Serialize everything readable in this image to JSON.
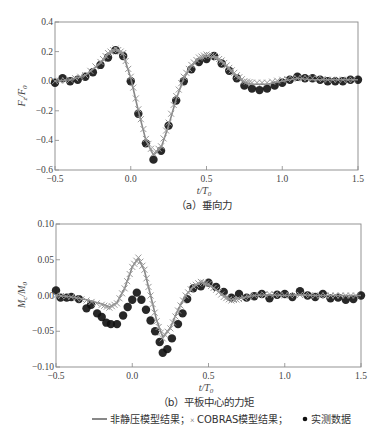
{
  "chart_data": [
    {
      "type": "line",
      "title": "(a) 垂向力",
      "caption": "（a）垂向力",
      "xlabel": "t/T0",
      "ylabel": "Fz/F0",
      "xlim": [
        -0.5,
        1.5
      ],
      "ylim": [
        -0.6,
        0.4
      ],
      "xticks": [
        "-0.5",
        "0.0",
        "0.5",
        "1.0",
        "1.5"
      ],
      "yticks": [
        "0.4",
        "0.2",
        "0.0",
        "-0.2",
        "-0.4",
        "-0.6"
      ],
      "grid": false,
      "series": [
        {
          "name": "非静压模型结果",
          "style": "line",
          "color": "#888888",
          "x": [
            -0.5,
            -0.4,
            -0.3,
            -0.2,
            -0.15,
            -0.1,
            -0.05,
            0.0,
            0.05,
            0.1,
            0.15,
            0.2,
            0.25,
            0.3,
            0.35,
            0.4,
            0.45,
            0.5,
            0.55,
            0.6,
            0.65,
            0.7,
            0.75,
            0.8,
            0.9,
            1.0,
            1.1,
            1.2,
            1.3,
            1.4,
            1.5
          ],
          "y": [
            0.0,
            0.01,
            0.04,
            0.12,
            0.18,
            0.21,
            0.18,
            0.02,
            -0.2,
            -0.4,
            -0.5,
            -0.45,
            -0.3,
            -0.12,
            0.02,
            0.1,
            0.15,
            0.17,
            0.16,
            0.13,
            0.08,
            0.03,
            -0.01,
            -0.02,
            -0.02,
            0.0,
            0.02,
            0.01,
            0.01,
            0.01,
            0.01
          ]
        },
        {
          "name": "COBRAS模型结果",
          "style": "x-marker",
          "color": "#999999",
          "x": [
            -0.5,
            -0.4,
            -0.3,
            -0.2,
            -0.15,
            -0.1,
            -0.05,
            0.0,
            0.05,
            0.1,
            0.15,
            0.2,
            0.25,
            0.3,
            0.35,
            0.4,
            0.45,
            0.5,
            0.55,
            0.6,
            0.65,
            0.7,
            0.75,
            0.8,
            0.9,
            1.0,
            1.1,
            1.2,
            1.3,
            1.4,
            1.5
          ],
          "y": [
            0.0,
            0.01,
            0.04,
            0.13,
            0.19,
            0.22,
            0.19,
            0.03,
            -0.19,
            -0.39,
            -0.49,
            -0.44,
            -0.28,
            -0.1,
            0.03,
            0.11,
            0.16,
            0.18,
            0.17,
            0.14,
            0.09,
            0.04,
            0.0,
            -0.01,
            -0.01,
            0.01,
            0.02,
            0.02,
            0.01,
            0.01,
            0.01
          ]
        },
        {
          "name": "实测数据",
          "style": "dot",
          "color": "#111111",
          "x": [
            -0.5,
            -0.45,
            -0.4,
            -0.35,
            -0.3,
            -0.25,
            -0.2,
            -0.15,
            -0.1,
            -0.05,
            0.0,
            0.05,
            0.1,
            0.15,
            0.2,
            0.25,
            0.3,
            0.35,
            0.4,
            0.45,
            0.5,
            0.55,
            0.6,
            0.65,
            0.7,
            0.75,
            0.8,
            0.85,
            0.9,
            0.95,
            1.0,
            1.05,
            1.1,
            1.15,
            1.2,
            1.25,
            1.3,
            1.35,
            1.4,
            1.45,
            1.5
          ],
          "y": [
            -0.01,
            0.02,
            0.0,
            0.01,
            0.03,
            0.06,
            0.11,
            0.16,
            0.21,
            0.17,
            0.0,
            -0.22,
            -0.42,
            -0.53,
            -0.47,
            -0.3,
            -0.13,
            0.0,
            0.08,
            0.13,
            0.15,
            0.17,
            0.12,
            0.07,
            0.02,
            -0.03,
            -0.05,
            -0.06,
            -0.05,
            -0.03,
            -0.01,
            0.01,
            0.03,
            0.02,
            0.02,
            0.01,
            0.0,
            0.0,
            0.0,
            0.01,
            0.01
          ]
        }
      ]
    },
    {
      "type": "line",
      "title": "(b) 平板中心的力矩",
      "caption": "（b）平板中心的力矩",
      "xlabel": "t/T0",
      "ylabel": "Mc/M0",
      "xlim": [
        -0.5,
        1.5
      ],
      "ylim": [
        -0.1,
        0.1
      ],
      "xticks": [
        "-0.5",
        "0.0",
        "0.5",
        "1.0",
        "1.5"
      ],
      "yticks": [
        "0.10",
        "0.05",
        "0.00",
        "-0.05",
        "-0.10"
      ],
      "grid": false,
      "series": [
        {
          "name": "非静压模型结果",
          "style": "line",
          "color": "#888888",
          "x": [
            -0.5,
            -0.4,
            -0.3,
            -0.2,
            -0.15,
            -0.1,
            -0.05,
            0.0,
            0.04,
            0.08,
            0.12,
            0.16,
            0.2,
            0.25,
            0.3,
            0.35,
            0.4,
            0.45,
            0.5,
            0.55,
            0.6,
            0.65,
            0.7,
            0.8,
            0.9,
            1.0,
            1.1,
            1.2,
            1.3,
            1.4,
            1.5
          ],
          "y": [
            0.0,
            -0.002,
            -0.006,
            -0.012,
            -0.016,
            -0.01,
            0.01,
            0.04,
            0.052,
            0.035,
            0.0,
            -0.035,
            -0.058,
            -0.045,
            -0.02,
            0.0,
            0.012,
            0.018,
            0.015,
            0.008,
            0.0,
            -0.006,
            -0.004,
            0.0,
            0.001,
            0.0,
            0.001,
            0.0,
            0.0,
            0.0,
            0.0
          ]
        },
        {
          "name": "COBRAS模型结果",
          "style": "x-marker",
          "color": "#999999",
          "x": [
            -0.5,
            -0.4,
            -0.3,
            -0.2,
            -0.15,
            -0.1,
            -0.05,
            0.0,
            0.04,
            0.08,
            0.12,
            0.16,
            0.2,
            0.25,
            0.3,
            0.35,
            0.4,
            0.45,
            0.5,
            0.55,
            0.6,
            0.65,
            0.7,
            0.8,
            0.9,
            1.0,
            1.1,
            1.2,
            1.3,
            1.4,
            1.5
          ],
          "y": [
            0.0,
            -0.002,
            -0.007,
            -0.013,
            -0.017,
            -0.011,
            0.01,
            0.04,
            0.053,
            0.036,
            0.0,
            -0.036,
            -0.06,
            -0.046,
            -0.021,
            0.0,
            0.013,
            0.019,
            0.016,
            0.008,
            -0.002,
            -0.007,
            -0.005,
            0.0,
            0.002,
            0.0,
            0.001,
            0.0,
            0.0,
            0.0,
            0.0
          ]
        },
        {
          "name": "实测数据",
          "style": "dot",
          "color": "#111111",
          "x": [
            -0.5,
            -0.47,
            -0.43,
            -0.4,
            -0.35,
            -0.3,
            -0.27,
            -0.23,
            -0.2,
            -0.17,
            -0.14,
            -0.1,
            -0.06,
            -0.03,
            0.0,
            0.03,
            0.06,
            0.09,
            0.12,
            0.15,
            0.18,
            0.2,
            0.23,
            0.26,
            0.3,
            0.33,
            0.36,
            0.4,
            0.45,
            0.5,
            0.55,
            0.6,
            0.65,
            0.7,
            0.75,
            0.8,
            0.85,
            0.9,
            0.95,
            1.0,
            1.05,
            1.1,
            1.15,
            1.2,
            1.25,
            1.3,
            1.35,
            1.4,
            1.45,
            1.5
          ],
          "y": [
            0.007,
            -0.003,
            -0.003,
            -0.002,
            -0.005,
            -0.018,
            -0.013,
            -0.025,
            -0.03,
            -0.038,
            -0.04,
            -0.04,
            -0.028,
            -0.016,
            -0.006,
            0.004,
            -0.006,
            -0.02,
            -0.035,
            -0.05,
            -0.065,
            -0.08,
            -0.075,
            -0.06,
            -0.04,
            -0.025,
            -0.005,
            0.01,
            0.013,
            0.018,
            0.012,
            0.005,
            -0.003,
            0.002,
            -0.003,
            -0.001,
            0.002,
            -0.004,
            0.001,
            0.002,
            -0.002,
            0.006,
            0.0,
            -0.002,
            0.002,
            -0.004,
            -0.003,
            -0.006,
            -0.005,
            0.0
          ]
        }
      ]
    }
  ],
  "legend": {
    "line_label": "非静压模型结果；",
    "cross_label": "COBRAS模型结果；",
    "dot_label": "实测数据"
  },
  "labels": {
    "a_ylabel": "Fz/F0",
    "b_ylabel": "Mc/M0",
    "xlabel": "t/T0"
  }
}
